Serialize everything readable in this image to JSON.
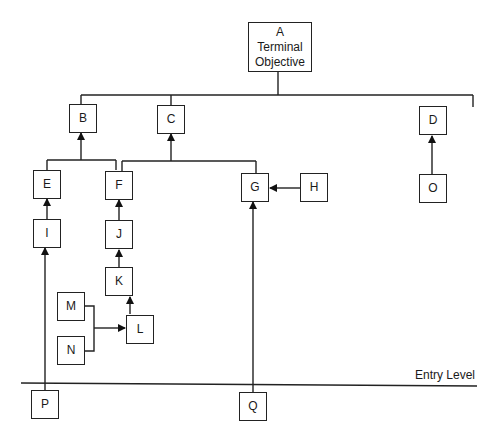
{
  "diagram": {
    "type": "learning-hierarchy",
    "nodes": {
      "A": {
        "label_line1": "A",
        "label_line2": "Terminal",
        "label_line3": "Objective"
      },
      "B": {
        "label": "B"
      },
      "C": {
        "label": "C"
      },
      "D": {
        "label": "D"
      },
      "E": {
        "label": "E"
      },
      "F": {
        "label": "F"
      },
      "G": {
        "label": "G"
      },
      "H": {
        "label": "H"
      },
      "I": {
        "label": "I"
      },
      "J": {
        "label": "J"
      },
      "K": {
        "label": "K"
      },
      "L": {
        "label": "L"
      },
      "M": {
        "label": "M"
      },
      "N": {
        "label": "N"
      },
      "O": {
        "label": "O"
      },
      "P": {
        "label": "P"
      },
      "Q": {
        "label": "Q"
      }
    },
    "edges": [
      {
        "from": "B",
        "to": "A"
      },
      {
        "from": "C",
        "to": "A"
      },
      {
        "from": "D",
        "to": "A"
      },
      {
        "from": "E",
        "to": "B"
      },
      {
        "from": "F",
        "to": "B"
      },
      {
        "from": "F",
        "to": "C"
      },
      {
        "from": "G",
        "to": "C"
      },
      {
        "from": "H",
        "to": "G"
      },
      {
        "from": "O",
        "to": "D"
      },
      {
        "from": "I",
        "to": "E"
      },
      {
        "from": "J",
        "to": "F"
      },
      {
        "from": "K",
        "to": "J"
      },
      {
        "from": "L",
        "to": "K"
      },
      {
        "from": "M",
        "to": "L"
      },
      {
        "from": "N",
        "to": "L"
      },
      {
        "from": "P",
        "to": "I"
      },
      {
        "from": "Q",
        "to": "G"
      }
    ],
    "entry_level_label": "Entry Level"
  }
}
